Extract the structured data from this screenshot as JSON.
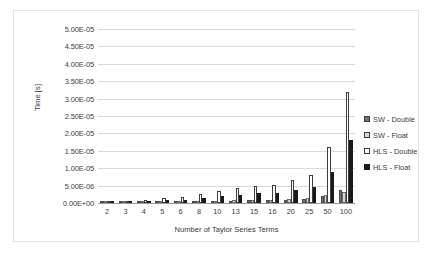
{
  "chart_data": {
    "type": "bar",
    "title": "",
    "xlabel": "Number of Taylor Series Terms",
    "ylabel": "Time [s]",
    "categories": [
      "2",
      "3",
      "4",
      "5",
      "6",
      "8",
      "10",
      "13",
      "15",
      "16",
      "20",
      "25",
      "50",
      "100"
    ],
    "ylim": [
      0,
      5e-05
    ],
    "ytick_labels": [
      "5.00E-05",
      "4.50E-05",
      "4.00E-05",
      "3.50E-05",
      "3.00E-05",
      "2.50E-05",
      "2.00E-05",
      "1.50E-05",
      "1.00E-05",
      "5.00E-06",
      "0.00E+00"
    ],
    "ytick_values": [
      5e-05,
      4.5e-05,
      4e-05,
      3.5e-05,
      3e-05,
      2.5e-05,
      2e-05,
      1.5e-05,
      1e-05,
      5e-06,
      0.0
    ],
    "grid": true,
    "legend_position": "right",
    "series": [
      {
        "name": "SW - Double",
        "color": "#737373",
        "values": [
          3e-07,
          3e-07,
          3e-07,
          3.5e-07,
          4e-07,
          5e-07,
          6e-07,
          7e-07,
          8e-07,
          8.5e-07,
          1e-06,
          1.2e-06,
          2.1e-06,
          3.8e-06
        ]
      },
      {
        "name": "SW - Float",
        "color": "#d6d6d6",
        "values": [
          2.5e-07,
          3e-07,
          3.5e-07,
          4e-07,
          4.5e-07,
          5.5e-07,
          6.5e-07,
          7.5e-07,
          8.5e-07,
          9e-07,
          1.1e-06,
          1.3e-06,
          2.3e-06,
          3.2e-06
        ]
      },
      {
        "name": "HLS - Double",
        "color": "#ffffff",
        "values": [
          4e-07,
          6.5e-07,
          9e-07,
          1.3e-06,
          1.7e-06,
          2.6e-06,
          3.4e-06,
          4.2e-06,
          4.9e-06,
          5.2e-06,
          6.5e-06,
          8.1e-06,
          1.6e-05,
          3.2e-05
        ]
      },
      {
        "name": "HLS - Float",
        "color": "#1a1a1a",
        "values": [
          3.5e-07,
          5e-07,
          7e-07,
          8.5e-07,
          1e-06,
          1.5e-06,
          1.9e-06,
          2.4e-06,
          2.8e-06,
          3e-06,
          3.7e-06,
          4.6e-06,
          9e-06,
          1.8e-05
        ]
      }
    ]
  },
  "legend": {
    "items": [
      {
        "label": "SW - Double"
      },
      {
        "label": "SW - Float"
      },
      {
        "label": "HLS - Double"
      },
      {
        "label": "HLS - Float"
      }
    ]
  }
}
